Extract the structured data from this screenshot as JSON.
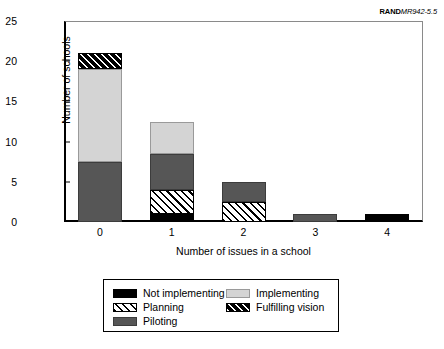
{
  "source_id": {
    "bold": "RAND",
    "rest": "MR942-5.5"
  },
  "axes": {
    "ylabel": "Number of schools",
    "xlabel": "Number of issues in a school",
    "yticks": [
      "0",
      "5",
      "10",
      "15",
      "20",
      "25"
    ],
    "xticks": [
      "0",
      "1",
      "2",
      "3",
      "4"
    ]
  },
  "legend": {
    "entries": [
      {
        "label": "Not implementing",
        "key": "not-implementing",
        "color": "#000000"
      },
      {
        "label": "Implementing",
        "key": "implementing",
        "color": "#d4d4d4"
      },
      {
        "label": "Planning",
        "key": "planning",
        "color": "#ffffff"
      },
      {
        "label": "Fulfilling vision",
        "key": "fulfilling-vision",
        "color": "#000000"
      },
      {
        "label": "Piloting",
        "key": "piloting",
        "color": "#565656"
      }
    ]
  },
  "chart_data": {
    "type": "bar",
    "stacked": true,
    "title": "",
    "xlabel": "Number of issues in a school",
    "ylabel": "Number of schools",
    "categories": [
      "0",
      "1",
      "2",
      "3",
      "4"
    ],
    "ylim": [
      0,
      25
    ],
    "ytick_step": 5,
    "grid": false,
    "legend_position": "bottom",
    "series": [
      {
        "name": "Not implementing",
        "color": "#000000",
        "pattern": "solid",
        "values": [
          0,
          1,
          0,
          0,
          1
        ]
      },
      {
        "name": "Planning",
        "color": "#ffffff",
        "pattern": "diagonal-hatch",
        "values": [
          0,
          3,
          2.5,
          0,
          0
        ]
      },
      {
        "name": "Piloting",
        "color": "#565656",
        "pattern": "solid",
        "values": [
          7.5,
          4.5,
          2.5,
          1,
          0
        ]
      },
      {
        "name": "Implementing",
        "color": "#d4d4d4",
        "pattern": "solid",
        "values": [
          11.5,
          4,
          0,
          0,
          0
        ]
      },
      {
        "name": "Fulfilling vision",
        "color": "#000000",
        "pattern": "white-diagonal-hatch",
        "values": [
          2,
          0,
          0,
          0,
          0
        ]
      }
    ],
    "totals": [
      21,
      12.5,
      5,
      1,
      1
    ]
  }
}
